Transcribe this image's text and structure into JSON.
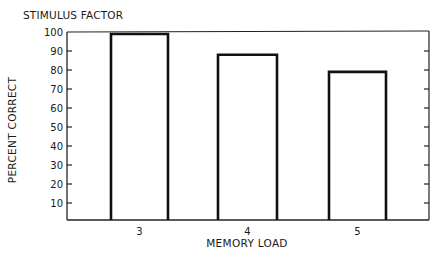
{
  "chart_data": {
    "type": "bar",
    "title": "STIMULUS FACTOR",
    "xlabel": "MEMORY LOAD",
    "ylabel": "PERCENT CORRECT",
    "categories": [
      "3",
      "4",
      "5"
    ],
    "values": [
      99,
      88,
      79
    ],
    "ylim": [
      0,
      100
    ],
    "yticks": [
      10,
      20,
      30,
      40,
      50,
      60,
      70,
      80,
      90,
      100
    ],
    "grid": false,
    "legend": null,
    "bar_style": "unfilled outline"
  },
  "colors": {
    "bar_outline": "#111111",
    "axis": "#222222",
    "background": "#ffffff"
  }
}
